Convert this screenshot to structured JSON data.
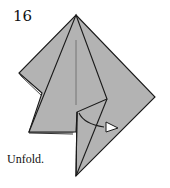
{
  "step": {
    "number": "16",
    "instruction": "Unfold."
  },
  "colors": {
    "paper": "#b3b3b3",
    "line": "#1a1a1a",
    "crease": "#6e6e6e",
    "arrow_fill": "#ffffff",
    "background": "#ffffff"
  },
  "icons": {
    "arrow": "unfold-arrow-icon"
  }
}
